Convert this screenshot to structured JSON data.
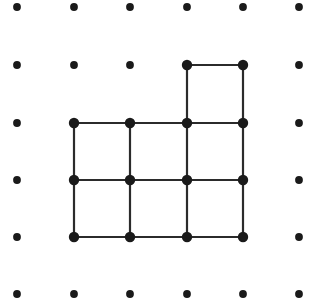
{
  "figure": {
    "name": "dot-grid-polyomino",
    "width": 322,
    "height": 299,
    "background_color": "#ffffff"
  },
  "lattice": {
    "columns": 6,
    "rows": 6,
    "origin_x": 17,
    "origin_y": 7,
    "spacing_x": 56.4,
    "spacing_y": 57.4,
    "dot_color": "#1a1a1a",
    "plain_dot_radius": 3.9,
    "vertex_dot_radius": 5.2,
    "points": [
      {
        "col": 0,
        "row": 0,
        "x": 17,
        "y": 7,
        "vertex": false
      },
      {
        "col": 1,
        "row": 0,
        "x": 74,
        "y": 7,
        "vertex": false
      },
      {
        "col": 2,
        "row": 0,
        "x": 130,
        "y": 7,
        "vertex": false
      },
      {
        "col": 3,
        "row": 0,
        "x": 187,
        "y": 7,
        "vertex": false
      },
      {
        "col": 4,
        "row": 0,
        "x": 243,
        "y": 7,
        "vertex": false
      },
      {
        "col": 5,
        "row": 0,
        "x": 299,
        "y": 7,
        "vertex": false
      },
      {
        "col": 0,
        "row": 1,
        "x": 17,
        "y": 65,
        "vertex": false
      },
      {
        "col": 1,
        "row": 1,
        "x": 74,
        "y": 65,
        "vertex": false
      },
      {
        "col": 2,
        "row": 1,
        "x": 130,
        "y": 65,
        "vertex": false
      },
      {
        "col": 3,
        "row": 1,
        "x": 187,
        "y": 65,
        "vertex": true
      },
      {
        "col": 4,
        "row": 1,
        "x": 243,
        "y": 65,
        "vertex": true
      },
      {
        "col": 5,
        "row": 1,
        "x": 299,
        "y": 65,
        "vertex": false
      },
      {
        "col": 0,
        "row": 2,
        "x": 17,
        "y": 123,
        "vertex": false
      },
      {
        "col": 1,
        "row": 2,
        "x": 74,
        "y": 123,
        "vertex": true
      },
      {
        "col": 2,
        "row": 2,
        "x": 130,
        "y": 123,
        "vertex": true
      },
      {
        "col": 3,
        "row": 2,
        "x": 187,
        "y": 123,
        "vertex": true
      },
      {
        "col": 4,
        "row": 2,
        "x": 243,
        "y": 123,
        "vertex": true
      },
      {
        "col": 5,
        "row": 2,
        "x": 299,
        "y": 123,
        "vertex": false
      },
      {
        "col": 0,
        "row": 3,
        "x": 17,
        "y": 180,
        "vertex": false
      },
      {
        "col": 1,
        "row": 3,
        "x": 74,
        "y": 180,
        "vertex": true
      },
      {
        "col": 2,
        "row": 3,
        "x": 130,
        "y": 180,
        "vertex": true
      },
      {
        "col": 3,
        "row": 3,
        "x": 187,
        "y": 180,
        "vertex": true
      },
      {
        "col": 4,
        "row": 3,
        "x": 243,
        "y": 180,
        "vertex": true
      },
      {
        "col": 5,
        "row": 3,
        "x": 299,
        "y": 180,
        "vertex": false
      },
      {
        "col": 0,
        "row": 4,
        "x": 17,
        "y": 237,
        "vertex": false
      },
      {
        "col": 1,
        "row": 4,
        "x": 74,
        "y": 237,
        "vertex": true
      },
      {
        "col": 2,
        "row": 4,
        "x": 130,
        "y": 237,
        "vertex": true
      },
      {
        "col": 3,
        "row": 4,
        "x": 187,
        "y": 237,
        "vertex": true
      },
      {
        "col": 4,
        "row": 4,
        "x": 243,
        "y": 237,
        "vertex": true
      },
      {
        "col": 5,
        "row": 4,
        "x": 299,
        "y": 237,
        "vertex": false
      },
      {
        "col": 0,
        "row": 5,
        "x": 17,
        "y": 294,
        "vertex": false
      },
      {
        "col": 1,
        "row": 5,
        "x": 74,
        "y": 294,
        "vertex": false
      },
      {
        "col": 2,
        "row": 5,
        "x": 130,
        "y": 294,
        "vertex": false
      },
      {
        "col": 3,
        "row": 5,
        "x": 187,
        "y": 294,
        "vertex": false
      },
      {
        "col": 4,
        "row": 5,
        "x": 243,
        "y": 294,
        "vertex": false
      },
      {
        "col": 5,
        "row": 5,
        "x": 299,
        "y": 294,
        "vertex": false
      }
    ]
  },
  "shape": {
    "name": "heptomino-outline",
    "line_color": "#2b2b2b",
    "line_width": 2.2,
    "cell_count": 7,
    "cells": [
      {
        "col": 3,
        "row": 1
      },
      {
        "col": 1,
        "row": 2
      },
      {
        "col": 2,
        "row": 2
      },
      {
        "col": 3,
        "row": 2
      },
      {
        "col": 1,
        "row": 3
      },
      {
        "col": 2,
        "row": 3
      },
      {
        "col": 3,
        "row": 3
      }
    ],
    "horizontal_segments": [
      {
        "x1": 187,
        "x2": 243,
        "y": 65
      },
      {
        "x1": 74,
        "x2": 243,
        "y": 123
      },
      {
        "x1": 74,
        "x2": 243,
        "y": 180
      },
      {
        "x1": 74,
        "x2": 243,
        "y": 237
      }
    ],
    "vertical_segments": [
      {
        "x": 187,
        "y1": 65,
        "y2": 237
      },
      {
        "x": 243,
        "y1": 65,
        "y2": 237
      },
      {
        "x": 74,
        "y1": 123,
        "y2": 237
      },
      {
        "x": 130,
        "y1": 123,
        "y2": 237
      }
    ]
  }
}
